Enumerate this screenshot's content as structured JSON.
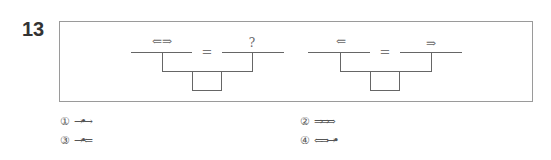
{
  "question": {
    "number": "13",
    "equations": [
      {
        "left_symbol": "⇐⇒",
        "operator": "=",
        "right_symbol": "?"
      },
      {
        "left_symbol": "⇐",
        "operator": "=",
        "right_symbol": "⇒"
      }
    ],
    "choices": [
      {
        "number": "①",
        "symbol": "→•→"
      },
      {
        "number": "②",
        "symbol": "⇒⇒⇒"
      },
      {
        "number": "③",
        "symbol": "→•⇐"
      },
      {
        "number": "④",
        "symbol": "⇐⇒→•"
      }
    ]
  }
}
